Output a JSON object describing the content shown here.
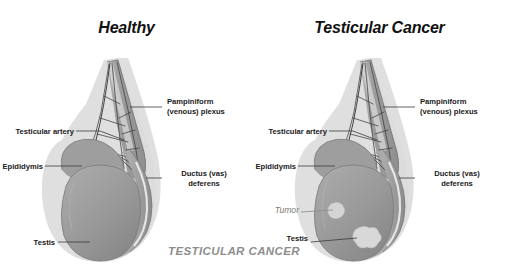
{
  "image": {
    "kind": "anatomical-diagram",
    "subject": "Testicle anatomy comparison, healthy versus testicular cancer",
    "background_color": "#ffffff"
  },
  "watermark": {
    "text": "TESTICULAR CANCER",
    "color": "#8d8d8d"
  },
  "palette": {
    "label_text": "#1a1a1a",
    "title_text": "#111111",
    "tumor_text": "#7c7c7c",
    "leader_line": "#3a3a3a",
    "organ_fill": "#9a9a9a",
    "organ_fill_dark": "#8a8a8a",
    "organ_halo": "#d9d9d9",
    "cord_fill": "#a5a5a5",
    "vessel_line": "#3c3c3c",
    "tumor_fill": "#d2d2d2",
    "highlight": "#f2f2f2"
  },
  "panels": [
    {
      "id": "healthy",
      "title": "Healthy",
      "has_tumor": false,
      "labels": [
        {
          "name": "pampiniform-plexus",
          "lines": [
            "Pampiniform",
            "(venous) plexus"
          ],
          "align": "left"
        },
        {
          "name": "testicular-artery",
          "lines": [
            "Testicular artery"
          ],
          "align": "right"
        },
        {
          "name": "epididymis",
          "lines": [
            "Epididymis"
          ],
          "align": "right"
        },
        {
          "name": "ductus-deferens",
          "lines": [
            "Ductus (vas)",
            "deferens"
          ],
          "align": "left"
        },
        {
          "name": "testis",
          "lines": [
            "Testis"
          ],
          "align": "right"
        }
      ]
    },
    {
      "id": "testicular-cancer",
      "title": "Testicular Cancer",
      "has_tumor": true,
      "labels": [
        {
          "name": "pampiniform-plexus",
          "lines": [
            "Pampiniform",
            "(venous) plexus"
          ],
          "align": "left"
        },
        {
          "name": "testicular-artery",
          "lines": [
            "Testicular artery"
          ],
          "align": "right"
        },
        {
          "name": "epididymis",
          "lines": [
            "Epididymis"
          ],
          "align": "right"
        },
        {
          "name": "ductus-deferens",
          "lines": [
            "Ductus (vas)",
            "deferens"
          ],
          "align": "left"
        },
        {
          "name": "tumor",
          "lines": [
            "Tumor"
          ],
          "align": "right"
        },
        {
          "name": "testis",
          "lines": [
            "Testis"
          ],
          "align": "right"
        }
      ]
    }
  ],
  "left": {
    "title": "Healthy",
    "pampiniform_line1": "Pampiniform",
    "pampiniform_line2": "(venous) plexus",
    "testicular_artery": "Testicular artery",
    "epididymis": "Epididymis",
    "ductus_line1": "Ductus (vas)",
    "ductus_line2": "deferens",
    "testis": "Testis"
  },
  "right": {
    "title": "Testicular Cancer",
    "pampiniform_line1": "Pampiniform",
    "pampiniform_line2": "(venous) plexus",
    "testicular_artery": "Testicular artery",
    "epididymis": "Epididymis",
    "ductus_line1": "Ductus (vas)",
    "ductus_line2": "deferens",
    "tumor": "Tumor",
    "testis": "Testis"
  }
}
